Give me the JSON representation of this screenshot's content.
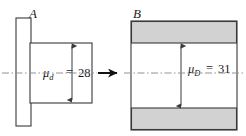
{
  "figure": {
    "canvas": {
      "width": 246,
      "height": 136,
      "background": "#ffffff"
    },
    "colors": {
      "outline": "#3a3a3a",
      "band_fill": "#d2d2d2",
      "part_fill": "#ffffff",
      "centerline": "#8f9298",
      "flow_arrow": "#111111",
      "text": "#1a1a1a"
    },
    "panels": [
      {
        "id": "panel-a",
        "label": "A",
        "dimension": {
          "symbol": "μ",
          "subscript": "d",
          "equals": "=",
          "value": "28",
          "full_text": "μd = 28"
        },
        "shapes": {
          "flange": {
            "x": 16,
            "y": 18,
            "width": 15,
            "height": 108,
            "fill": "#ffffff"
          },
          "body": {
            "x": 30,
            "y": 43,
            "width": 62,
            "height": 60,
            "fill": "#ffffff"
          }
        },
        "dim_arrow": {
          "x": 72,
          "y_top": 45,
          "y_bottom": 101
        }
      },
      {
        "id": "panel-b",
        "label": "B",
        "dimension": {
          "symbol": "μ",
          "subscript": "D",
          "equals": "=",
          "value": "31",
          "full_text": "μD = 31"
        },
        "shapes": {
          "outer": {
            "x": 131,
            "y": 21,
            "width": 106,
            "height": 109,
            "fill": "#ffffff"
          },
          "top_band": {
            "x": 132,
            "y": 22,
            "width": 104,
            "height": 21,
            "fill": "#d2d2d2"
          },
          "bottom_band": {
            "x": 132,
            "y": 108,
            "width": 104,
            "height": 21,
            "fill": "#d2d2d2"
          }
        },
        "dim_arrow": {
          "x": 181,
          "y_top": 45,
          "y_bottom": 107
        }
      }
    ],
    "flow_arrow": {
      "name": "process-flow-arrow",
      "x_start": 98,
      "x_end": 120,
      "y": 73,
      "direction": "right"
    },
    "centerline": {
      "name": "axis-centerline",
      "y": 73,
      "x_start": 2,
      "x_end": 244,
      "style": "dash-dot"
    }
  }
}
